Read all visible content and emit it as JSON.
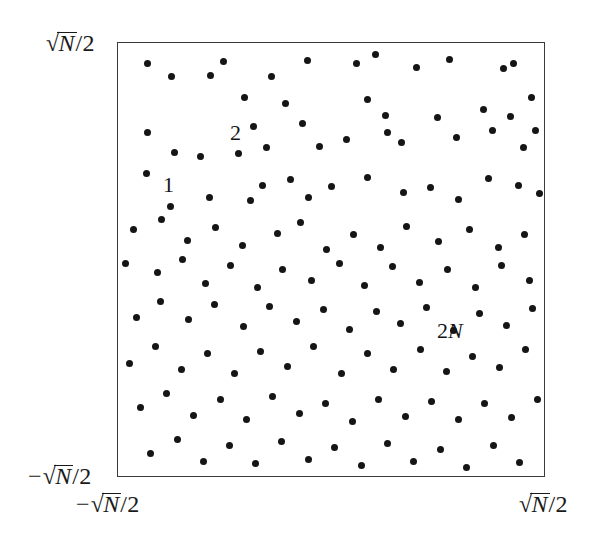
{
  "figure": {
    "name": "random-point-scatter-square",
    "frame": {
      "x": 117,
      "y": 42,
      "width": 428,
      "height": 435,
      "border_color": "#3a3a3a"
    },
    "point_color": "#151515",
    "point_diameter": 7
  },
  "axes": {
    "y_max_label": {
      "minus": "",
      "surd": "√",
      "radicand": "N",
      "slash": "/",
      "denominator": "2"
    },
    "y_min_label": {
      "minus": "−",
      "surd": "√",
      "radicand": "N",
      "slash": "/",
      "denominator": "2"
    },
    "x_min_label": {
      "minus": "−",
      "surd": "√",
      "radicand": "N",
      "slash": "/",
      "denominator": "2"
    },
    "x_max_label": {
      "minus": "",
      "surd": "√",
      "radicand": "N",
      "slash": "/",
      "denominator": "2"
    }
  },
  "annotations": [
    {
      "id": "annot-1",
      "text": "1",
      "italic_part": "",
      "x": 163,
      "y": 174
    },
    {
      "id": "annot-2",
      "text": "2",
      "italic_part": "",
      "x": 230,
      "y": 122
    },
    {
      "id": "annot-2n",
      "text": "2",
      "italic_part": "N",
      "x": 437,
      "y": 320
    }
  ],
  "chart_data": {
    "type": "scatter",
    "title": "",
    "xlabel": "",
    "ylabel": "",
    "xlim": [
      "-sqrt(N)/2",
      "sqrt(N)/2"
    ],
    "ylim": [
      "-sqrt(N)/2",
      "sqrt(N)/2"
    ],
    "grid": false,
    "legend": "none",
    "marker": "filled-circle",
    "n_points": 128,
    "note": "Uniformly random points in a square of side sqrt(N); labelled points 1, 2, ... 2N",
    "points_px": [
      [
        146,
        62
      ],
      [
        170,
        75
      ],
      [
        209,
        74
      ],
      [
        222,
        60
      ],
      [
        270,
        75
      ],
      [
        306,
        59
      ],
      [
        355,
        62
      ],
      [
        374,
        53
      ],
      [
        415,
        66
      ],
      [
        448,
        58
      ],
      [
        502,
        67
      ],
      [
        512,
        62
      ],
      [
        243,
        96
      ],
      [
        284,
        102
      ],
      [
        366,
        98
      ],
      [
        384,
        114
      ],
      [
        436,
        116
      ],
      [
        482,
        108
      ],
      [
        509,
        115
      ],
      [
        530,
        96
      ],
      [
        146,
        131
      ],
      [
        173,
        151
      ],
      [
        199,
        155
      ],
      [
        237,
        152
      ],
      [
        252,
        125
      ],
      [
        265,
        146
      ],
      [
        301,
        122
      ],
      [
        318,
        145
      ],
      [
        345,
        138
      ],
      [
        386,
        131
      ],
      [
        400,
        141
      ],
      [
        455,
        136
      ],
      [
        491,
        129
      ],
      [
        522,
        146
      ],
      [
        534,
        129
      ],
      [
        145,
        172
      ],
      [
        169,
        205
      ],
      [
        208,
        196
      ],
      [
        249,
        199
      ],
      [
        261,
        184
      ],
      [
        289,
        178
      ],
      [
        307,
        196
      ],
      [
        330,
        185
      ],
      [
        366,
        176
      ],
      [
        402,
        191
      ],
      [
        429,
        186
      ],
      [
        457,
        198
      ],
      [
        487,
        177
      ],
      [
        517,
        184
      ],
      [
        538,
        192
      ],
      [
        132,
        228
      ],
      [
        160,
        218
      ],
      [
        186,
        239
      ],
      [
        214,
        226
      ],
      [
        241,
        244
      ],
      [
        276,
        232
      ],
      [
        299,
        221
      ],
      [
        325,
        248
      ],
      [
        352,
        233
      ],
      [
        379,
        246
      ],
      [
        405,
        225
      ],
      [
        437,
        240
      ],
      [
        468,
        228
      ],
      [
        497,
        246
      ],
      [
        523,
        233
      ],
      [
        124,
        262
      ],
      [
        156,
        271
      ],
      [
        181,
        258
      ],
      [
        204,
        282
      ],
      [
        229,
        264
      ],
      [
        256,
        286
      ],
      [
        281,
        268
      ],
      [
        310,
        279
      ],
      [
        338,
        262
      ],
      [
        363,
        284
      ],
      [
        391,
        265
      ],
      [
        418,
        281
      ],
      [
        446,
        268
      ],
      [
        474,
        286
      ],
      [
        500,
        264
      ],
      [
        528,
        279
      ],
      [
        135,
        316
      ],
      [
        159,
        300
      ],
      [
        187,
        318
      ],
      [
        213,
        303
      ],
      [
        242,
        325
      ],
      [
        268,
        305
      ],
      [
        295,
        320
      ],
      [
        322,
        308
      ],
      [
        348,
        328
      ],
      [
        375,
        310
      ],
      [
        399,
        322
      ],
      [
        425,
        306
      ],
      [
        452,
        329
      ],
      [
        478,
        312
      ],
      [
        505,
        324
      ],
      [
        531,
        307
      ],
      [
        128,
        362
      ],
      [
        154,
        345
      ],
      [
        180,
        368
      ],
      [
        206,
        352
      ],
      [
        233,
        372
      ],
      [
        259,
        350
      ],
      [
        286,
        365
      ],
      [
        312,
        345
      ],
      [
        340,
        372
      ],
      [
        366,
        352
      ],
      [
        392,
        368
      ],
      [
        419,
        348
      ],
      [
        445,
        370
      ],
      [
        471,
        355
      ],
      [
        498,
        366
      ],
      [
        524,
        348
      ],
      [
        139,
        406
      ],
      [
        165,
        392
      ],
      [
        192,
        414
      ],
      [
        219,
        398
      ],
      [
        245,
        418
      ],
      [
        271,
        395
      ],
      [
        298,
        412
      ],
      [
        324,
        402
      ],
      [
        351,
        420
      ],
      [
        377,
        398
      ],
      [
        404,
        415
      ],
      [
        430,
        400
      ],
      [
        457,
        418
      ],
      [
        483,
        402
      ],
      [
        510,
        416
      ],
      [
        536,
        398
      ],
      [
        149,
        452
      ],
      [
        176,
        438
      ],
      [
        202,
        460
      ],
      [
        228,
        444
      ],
      [
        254,
        462
      ],
      [
        280,
        440
      ],
      [
        307,
        458
      ],
      [
        333,
        446
      ],
      [
        360,
        464
      ],
      [
        386,
        442
      ],
      [
        412,
        460
      ],
      [
        439,
        448
      ],
      [
        465,
        466
      ],
      [
        492,
        444
      ],
      [
        518,
        461
      ]
    ]
  }
}
